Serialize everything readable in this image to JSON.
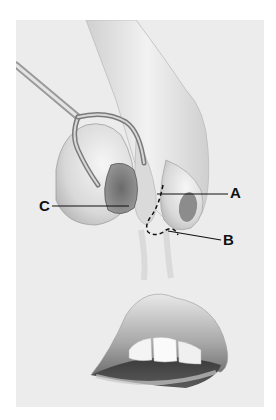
{
  "figure": {
    "type": "anatomical-illustration",
    "background_color": "#ececec",
    "labels": [
      {
        "id": "A",
        "text": "A",
        "target": "dashed incision line along alar rim"
      },
      {
        "id": "B",
        "text": "B",
        "target": "lower end of dashed incision at nasal sill"
      },
      {
        "id": "C",
        "text": "C",
        "target": "nostril opening held by retractor"
      }
    ],
    "elements": [
      "nose",
      "retractor-instrument",
      "dashed-incision-line",
      "upper-lip",
      "lower-lip",
      "teeth"
    ]
  }
}
